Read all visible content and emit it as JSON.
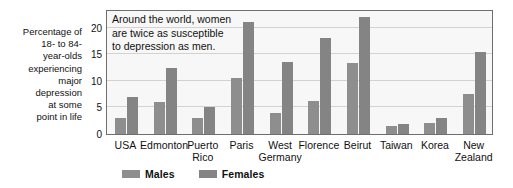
{
  "chart_data": {
    "type": "bar",
    "title": "",
    "subtitle": "",
    "annotation": [
      "Around the world, women",
      "are twice as susceptible",
      "to depression as men."
    ],
    "categories": [
      "USA",
      "Edmonton",
      "Puerto Rico",
      "Paris",
      "West Germany",
      "Florence",
      "Beirut",
      "Taiwan",
      "Korea",
      "New Zealand"
    ],
    "category_lines": [
      [
        "USA"
      ],
      [
        "Edmonton"
      ],
      [
        "Puerto",
        "Rico"
      ],
      [
        "Paris"
      ],
      [
        "West",
        "Germany"
      ],
      [
        "Florence"
      ],
      [
        "Beirut"
      ],
      [
        "Taiwan"
      ],
      [
        "Korea"
      ],
      [
        "New",
        "Zealand"
      ]
    ],
    "series": [
      {
        "name": "Males",
        "color": "#8e8e8e",
        "values": [
          3.0,
          6.0,
          3.0,
          10.5,
          4.0,
          6.3,
          13.3,
          1.5,
          2.0,
          7.5
        ]
      },
      {
        "name": "Females",
        "color": "#848484",
        "values": [
          7.0,
          12.5,
          5.0,
          21.0,
          13.5,
          18.0,
          22.0,
          1.8,
          3.0,
          15.5
        ]
      }
    ],
    "xlabel": "",
    "ylabel": "Percentage of 18- to 84-year-olds experiencing major depression at some point in life",
    "ylabel_lines": [
      "Percentage of",
      "18- to 84-",
      "year-olds",
      "experiencing",
      "major",
      "depression",
      "at some",
      "point in life"
    ],
    "ylim": [
      0,
      23.5
    ],
    "yticks": [
      0,
      5,
      10,
      15,
      20
    ],
    "ytick_labels": [
      "0",
      "5",
      "10",
      "15",
      "20"
    ],
    "grid": true,
    "legend_position": "bottom-left",
    "legend": [
      "Males",
      "Females"
    ],
    "plot_background": "#f7f7f7"
  }
}
